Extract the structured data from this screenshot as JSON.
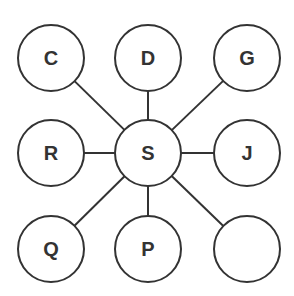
{
  "diagram": {
    "type": "star-graph",
    "stroke_color": "#333333",
    "fill_color": "#ffffff",
    "label_color": "#333333",
    "node_radius": 33,
    "center": {
      "id": "S",
      "label": "S",
      "x": 148,
      "y": 153
    },
    "nodes": [
      {
        "id": "C",
        "label": "C",
        "x": 51,
        "y": 58
      },
      {
        "id": "D",
        "label": "D",
        "x": 148,
        "y": 58
      },
      {
        "id": "G",
        "label": "G",
        "x": 247,
        "y": 58
      },
      {
        "id": "R",
        "label": "R",
        "x": 51,
        "y": 153
      },
      {
        "id": "J",
        "label": "J",
        "x": 247,
        "y": 153
      },
      {
        "id": "Q",
        "label": "Q",
        "x": 51,
        "y": 249
      },
      {
        "id": "P",
        "label": "P",
        "x": 148,
        "y": 249
      },
      {
        "id": "blank",
        "label": "",
        "x": 247,
        "y": 249
      }
    ],
    "edges": [
      [
        "S",
        "C"
      ],
      [
        "S",
        "D"
      ],
      [
        "S",
        "G"
      ],
      [
        "S",
        "R"
      ],
      [
        "S",
        "J"
      ],
      [
        "S",
        "Q"
      ],
      [
        "S",
        "P"
      ],
      [
        "S",
        "blank"
      ]
    ]
  }
}
